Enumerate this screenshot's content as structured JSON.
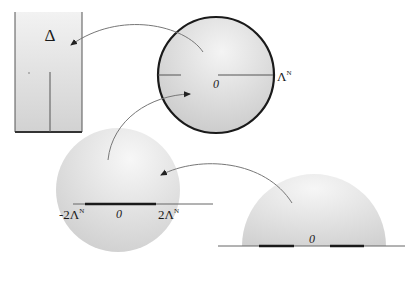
{
  "diagram": {
    "rectangle": {
      "label": "Δ"
    },
    "top_circle": {
      "origin_label": "0",
      "radius_label": "Λ",
      "radius_label_sup": "N"
    },
    "middle_disc": {
      "origin_label": "0",
      "left_label": "-2Λ",
      "left_label_sup": "N",
      "right_label": "2Λ",
      "right_label_sup": "N"
    },
    "half_disc": {
      "origin_label": "0"
    },
    "arrows": [
      {
        "from": "top_circle",
        "to": "rectangle"
      },
      {
        "from": "middle_disc",
        "to": "top_circle"
      },
      {
        "from": "half_disc",
        "to": "middle_disc"
      }
    ],
    "colors": {
      "stroke": "#1a1a1a",
      "fill_light": "#eeeeee",
      "fill_dark": "#c8c8c8",
      "arrow": "#666666"
    }
  }
}
